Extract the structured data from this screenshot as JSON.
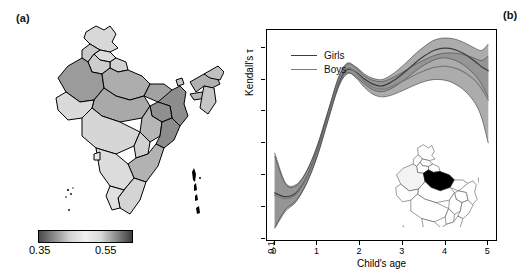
{
  "figure": {
    "panel_a_label": "(a)",
    "panel_b_label": "(b)"
  },
  "panel_a": {
    "type": "choropleth-map",
    "region": "India",
    "colorbar": {
      "min_label": "0.35",
      "max_label": "0.55",
      "gradient_stops": [
        "#4a4a4a",
        "#8d8d8d",
        "#d2d2d2",
        "#f0f0f0",
        "#d8d8d8",
        "#8a8a8a",
        "#3c3c3c"
      ]
    },
    "state_fills": {
      "very_dark": "#8f8f8f",
      "dark": "#9e9e9e",
      "mid": "#b4b4b4",
      "light": "#cfcfcf",
      "very_light": "#e2e2e2",
      "outline": "#000000"
    }
  },
  "panel_b": {
    "legend": [
      {
        "label": "Girls",
        "color": "#3d3d3d"
      },
      {
        "label": "Boys",
        "color": "#7a7a7a"
      }
    ],
    "inset": {
      "type": "locator-map",
      "region": "India",
      "highlight_fill": "#000000",
      "outline": "#444444"
    }
  },
  "chart_data": {
    "type": "line",
    "title": "",
    "xlabel": "Child's age",
    "ylabel": "Kendall's τ",
    "xlim": [
      -0.18,
      5.18
    ],
    "ylim": [
      0.148,
      0.478
    ],
    "xticks": [
      0,
      1,
      2,
      3,
      4,
      5
    ],
    "xtick_labels": [
      "0",
      "1",
      "2",
      "3",
      "4",
      "5"
    ],
    "yticks": [
      0.15,
      0.2,
      0.25,
      0.3,
      0.35,
      0.4,
      0.45
    ],
    "ytick_labels": [
      "0.15",
      "0.20",
      "0.25",
      "0.30",
      "0.35",
      "0.40",
      "0.45"
    ],
    "grid": false,
    "legend_position": "top-left",
    "band_style": {
      "fill": "#8c8c8c",
      "opacity": 0.72,
      "overlap_fill": "#5a5a5a"
    },
    "x": [
      0.0,
      0.25,
      0.5,
      0.75,
      1.0,
      1.25,
      1.5,
      1.7,
      1.9,
      2.1,
      2.3,
      2.5,
      2.7,
      2.9,
      3.1,
      3.3,
      3.5,
      3.7,
      3.9,
      4.1,
      4.3,
      4.5,
      4.7,
      4.85,
      5.0
    ],
    "series": [
      {
        "name": "Girls",
        "color": "#3d3d3d",
        "values": [
          0.222,
          0.216,
          0.222,
          0.247,
          0.289,
          0.344,
          0.396,
          0.416,
          0.412,
          0.401,
          0.393,
          0.39,
          0.395,
          0.404,
          0.415,
          0.427,
          0.437,
          0.445,
          0.449,
          0.449,
          0.445,
          0.438,
          0.428,
          0.42,
          0.414
        ],
        "ci_lower": [
          0.168,
          0.196,
          0.21,
          0.238,
          0.281,
          0.337,
          0.389,
          0.409,
          0.405,
          0.393,
          0.384,
          0.381,
          0.385,
          0.393,
          0.403,
          0.414,
          0.423,
          0.43,
          0.434,
          0.433,
          0.428,
          0.419,
          0.406,
          0.392,
          0.372
        ],
        "ci_upper": [
          0.285,
          0.238,
          0.235,
          0.257,
          0.297,
          0.351,
          0.403,
          0.424,
          0.42,
          0.409,
          0.402,
          0.4,
          0.406,
          0.416,
          0.428,
          0.441,
          0.452,
          0.461,
          0.465,
          0.465,
          0.462,
          0.456,
          0.449,
          0.446,
          0.456
        ]
      },
      {
        "name": "Boys",
        "color": "#7a7a7a",
        "values": [
          0.218,
          0.213,
          0.22,
          0.246,
          0.288,
          0.343,
          0.398,
          0.418,
          0.411,
          0.397,
          0.388,
          0.385,
          0.388,
          0.394,
          0.401,
          0.408,
          0.414,
          0.419,
          0.421,
          0.42,
          0.416,
          0.409,
          0.398,
          0.385,
          0.368
        ],
        "ci_lower": [
          0.166,
          0.193,
          0.208,
          0.237,
          0.28,
          0.336,
          0.391,
          0.411,
          0.403,
          0.388,
          0.377,
          0.373,
          0.375,
          0.38,
          0.386,
          0.392,
          0.397,
          0.4,
          0.4,
          0.397,
          0.39,
          0.379,
          0.362,
          0.339,
          0.3
        ],
        "ci_upper": [
          0.28,
          0.236,
          0.233,
          0.256,
          0.296,
          0.35,
          0.405,
          0.426,
          0.419,
          0.406,
          0.399,
          0.397,
          0.401,
          0.408,
          0.416,
          0.424,
          0.431,
          0.437,
          0.441,
          0.442,
          0.441,
          0.438,
          0.433,
          0.43,
          0.437
        ]
      }
    ]
  }
}
